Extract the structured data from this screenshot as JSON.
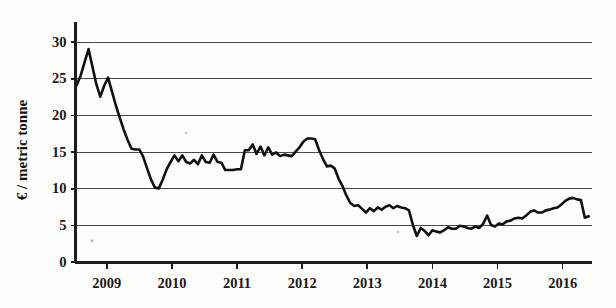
{
  "chart_data": {
    "type": "line",
    "title": "",
    "subtitle": "",
    "xlabel": "",
    "ylabel": "€ / metric tonne",
    "xlim": [
      2008.52,
      2016.45
    ],
    "ylim": [
      0,
      32
    ],
    "yticks": [
      0,
      5,
      10,
      15,
      20,
      25,
      30
    ],
    "ytick_labels": [
      "0",
      "5",
      "10",
      "15",
      "20",
      "25",
      "30"
    ],
    "xticks": [
      2009,
      2010,
      2011,
      2012,
      2013,
      2014,
      2015,
      2016
    ],
    "xtick_labels": [
      "2009",
      "2010",
      "2011",
      "2012",
      "2013",
      "2014",
      "2015",
      "2016"
    ],
    "grid": "horizontal",
    "legend": "none",
    "series": [
      {
        "name": "price",
        "color": "#111111",
        "x": [
          2008.54,
          2008.6,
          2008.66,
          2008.72,
          2008.78,
          2008.84,
          2008.9,
          2008.96,
          2009.02,
          2009.08,
          2009.14,
          2009.2,
          2009.26,
          2009.32,
          2009.38,
          2009.44,
          2009.5,
          2009.56,
          2009.62,
          2009.68,
          2009.74,
          2009.8,
          2009.86,
          2009.92,
          2009.98,
          2010.04,
          2010.1,
          2010.16,
          2010.22,
          2010.28,
          2010.34,
          2010.4,
          2010.46,
          2010.52,
          2010.58,
          2010.64,
          2010.7,
          2010.76,
          2010.82,
          2010.88,
          2010.94,
          2011.0,
          2011.06,
          2011.12,
          2011.18,
          2011.24,
          2011.3,
          2011.36,
          2011.42,
          2011.48,
          2011.54,
          2011.6,
          2011.66,
          2011.72,
          2011.78,
          2011.84,
          2011.9,
          2011.96,
          2012.02,
          2012.08,
          2012.14,
          2012.2,
          2012.26,
          2012.32,
          2012.38,
          2012.44,
          2012.5,
          2012.56,
          2012.62,
          2012.68,
          2012.74,
          2012.8,
          2012.86,
          2012.92,
          2012.98,
          2013.04,
          2013.1,
          2013.16,
          2013.22,
          2013.28,
          2013.34,
          2013.4,
          2013.46,
          2013.52,
          2013.58,
          2013.64,
          2013.7,
          2013.76,
          2013.82,
          2013.88,
          2013.94,
          2014.0,
          2014.06,
          2014.12,
          2014.18,
          2014.24,
          2014.3,
          2014.36,
          2014.42,
          2014.48,
          2014.54,
          2014.6,
          2014.66,
          2014.72,
          2014.78,
          2014.84,
          2014.9,
          2014.96,
          2015.02,
          2015.08,
          2015.14,
          2015.2,
          2015.26,
          2015.32,
          2015.38,
          2015.44,
          2015.5,
          2015.56,
          2015.62,
          2015.68,
          2015.74,
          2015.8,
          2015.86,
          2015.92,
          2015.98,
          2016.04,
          2016.1,
          2016.16,
          2016.22,
          2016.28,
          2016.34,
          2016.4
        ],
        "y": [
          24.1,
          25.4,
          27.2,
          29.0,
          26.6,
          24.2,
          22.5,
          24.0,
          25.1,
          23.2,
          21.3,
          19.6,
          18.0,
          16.6,
          15.4,
          15.3,
          15.3,
          14.3,
          12.7,
          11.2,
          10.1,
          10.0,
          11.2,
          12.6,
          13.6,
          14.5,
          13.7,
          14.5,
          13.6,
          13.4,
          13.9,
          13.3,
          14.5,
          13.6,
          13.5,
          14.6,
          13.6,
          13.5,
          12.5,
          12.5,
          12.5,
          12.6,
          12.6,
          15.2,
          15.2,
          16.0,
          14.7,
          15.7,
          14.5,
          15.6,
          14.6,
          14.9,
          14.4,
          14.6,
          14.5,
          14.4,
          15.0,
          15.6,
          16.4,
          16.8,
          16.8,
          16.7,
          15.2,
          14.0,
          13.0,
          13.1,
          12.7,
          11.3,
          10.3,
          9.0,
          8.0,
          7.6,
          7.7,
          7.2,
          6.7,
          7.3,
          6.9,
          7.4,
          7.1,
          7.5,
          7.7,
          7.3,
          7.6,
          7.4,
          7.3,
          7.0,
          5.0,
          3.5,
          4.6,
          4.2,
          3.6,
          4.3,
          4.1,
          4.0,
          4.3,
          4.7,
          4.5,
          4.5,
          4.9,
          4.8,
          4.6,
          4.5,
          4.8,
          4.6,
          5.2,
          6.3,
          5.0,
          4.8,
          5.2,
          5.1,
          5.5,
          5.6,
          5.9,
          6.0,
          5.9,
          6.3,
          6.8,
          7.0,
          6.7,
          6.7,
          7.0,
          7.1,
          7.3,
          7.4,
          7.8,
          8.3,
          8.6,
          8.7,
          8.5,
          8.4,
          6.0,
          6.2
        ]
      }
    ]
  },
  "axis": {
    "y_title": "€ / metric tonne"
  }
}
